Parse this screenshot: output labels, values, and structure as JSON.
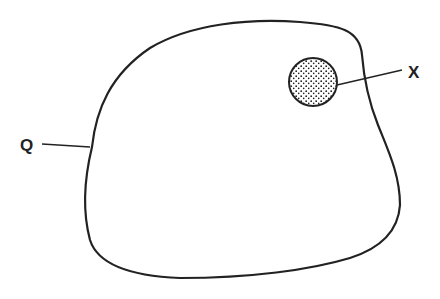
{
  "diagram": {
    "labels": {
      "outer": "Q",
      "inner": "X"
    },
    "colors": {
      "stroke": "#222222",
      "background": "#ffffff",
      "stipple": "#222222"
    }
  }
}
